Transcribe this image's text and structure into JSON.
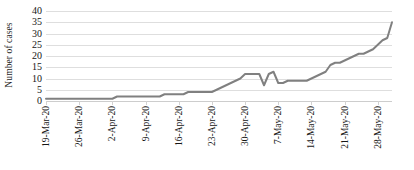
{
  "chart_data": {
    "type": "line",
    "title": "",
    "xlabel": "",
    "ylabel": "Number of cases",
    "ylim": [
      0,
      40
    ],
    "ytick_values": [
      0,
      5,
      10,
      15,
      20,
      25,
      30,
      35,
      40
    ],
    "ytick_labels": [
      "0",
      "5",
      "10",
      "15",
      "20",
      "25",
      "30",
      "35",
      "40"
    ],
    "grid": true,
    "legend": "none",
    "line_color": "#808080",
    "line_width": 2,
    "xtick_labels": [
      "19-Mar-20",
      "26-Mar-20",
      "2-Apr-20",
      "9-Apr-20",
      "16-Apr-20",
      "23-Apr-20",
      "30-Apr-20",
      "7-May-20",
      "14-May-20",
      "21-May-20",
      "28-May-20"
    ],
    "xtick_indices": [
      0,
      7,
      14,
      21,
      28,
      35,
      42,
      49,
      56,
      63,
      70
    ],
    "x": [
      "19-Mar-20",
      "20-Mar-20",
      "21-Mar-20",
      "22-Mar-20",
      "23-Mar-20",
      "24-Mar-20",
      "25-Mar-20",
      "26-Mar-20",
      "27-Mar-20",
      "28-Mar-20",
      "29-Mar-20",
      "30-Mar-20",
      "31-Mar-20",
      "1-Apr-20",
      "2-Apr-20",
      "3-Apr-20",
      "4-Apr-20",
      "5-Apr-20",
      "6-Apr-20",
      "7-Apr-20",
      "8-Apr-20",
      "9-Apr-20",
      "10-Apr-20",
      "11-Apr-20",
      "12-Apr-20",
      "13-Apr-20",
      "14-Apr-20",
      "15-Apr-20",
      "16-Apr-20",
      "17-Apr-20",
      "18-Apr-20",
      "19-Apr-20",
      "20-Apr-20",
      "21-Apr-20",
      "22-Apr-20",
      "23-Apr-20",
      "24-Apr-20",
      "25-Apr-20",
      "26-Apr-20",
      "27-Apr-20",
      "28-Apr-20",
      "29-Apr-20",
      "30-Apr-20",
      "1-May-20",
      "2-May-20",
      "3-May-20",
      "4-May-20",
      "5-May-20",
      "6-May-20",
      "7-May-20",
      "8-May-20",
      "9-May-20",
      "10-May-20",
      "11-May-20",
      "12-May-20",
      "13-May-20",
      "14-May-20",
      "15-May-20",
      "16-May-20",
      "17-May-20",
      "18-May-20",
      "19-May-20",
      "20-May-20",
      "21-May-20",
      "22-May-20",
      "23-May-20",
      "24-May-20",
      "25-May-20",
      "26-May-20",
      "27-May-20",
      "28-May-20",
      "29-May-20",
      "30-May-20",
      "31-May-20"
    ],
    "values": [
      1,
      1,
      1,
      1,
      1,
      1,
      1,
      1,
      1,
      1,
      1,
      1,
      1,
      1,
      1,
      2,
      2,
      2,
      2,
      2,
      2,
      2,
      2,
      2,
      2,
      3,
      3,
      3,
      3,
      3,
      4,
      4,
      4,
      4,
      4,
      4,
      5,
      6,
      7,
      8,
      9,
      10,
      12,
      12,
      12,
      12,
      7,
      12,
      13,
      8,
      8,
      9,
      9,
      9,
      9,
      9,
      10,
      11,
      12,
      13,
      16,
      17,
      17,
      18,
      19,
      20,
      21,
      21,
      22,
      23,
      25,
      27,
      28,
      35
    ]
  }
}
